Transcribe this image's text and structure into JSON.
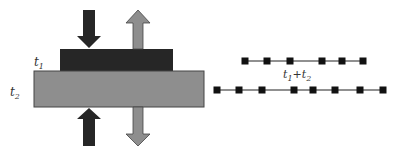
{
  "diagram": {
    "labels": {
      "t1": {
        "base": "t",
        "sub": "1"
      },
      "t2": {
        "base": "t",
        "sub": "2"
      },
      "sum": {
        "a": "t",
        "a_sub": "1",
        "op": "+",
        "b": "t",
        "b_sub": "2"
      }
    },
    "colors": {
      "dark": "#262626",
      "gray": "#8e8e8e",
      "outline": "#444444",
      "line": "#222222"
    },
    "blocks": [
      {
        "name": "layer-t1",
        "x": 60,
        "y": 49,
        "w": 113,
        "h": 22,
        "color": "dark"
      },
      {
        "name": "layer-t2",
        "x": 34,
        "y": 71,
        "w": 170,
        "h": 36,
        "color": "gray"
      }
    ],
    "arrows": [
      {
        "name": "compress-down-arrow",
        "color": "dark",
        "direction": "down"
      },
      {
        "name": "compress-up-arrow",
        "color": "dark",
        "direction": "up"
      },
      {
        "name": "tension-up-arrow",
        "color": "gray",
        "direction": "up"
      },
      {
        "name": "tension-down-arrow",
        "color": "gray",
        "direction": "down"
      }
    ],
    "chains": [
      {
        "name": "chain-top",
        "y": 61,
        "x_start": 245,
        "x_end": 363,
        "nodes": [
          245,
          267,
          290,
          322,
          342,
          363
        ]
      },
      {
        "name": "chain-bottom",
        "y": 90,
        "x_start": 217,
        "x_end": 383,
        "nodes": [
          217,
          239,
          262,
          294,
          313,
          335,
          360,
          383
        ]
      }
    ]
  }
}
